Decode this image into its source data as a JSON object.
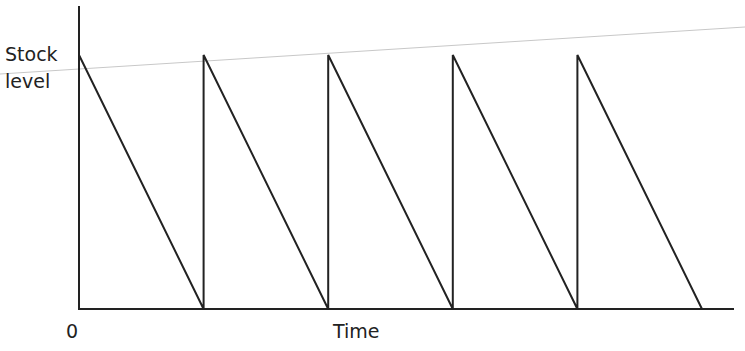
{
  "chart_data": {
    "type": "line",
    "title": "",
    "xlabel": "Time",
    "ylabel": "Stock level",
    "ylabel_lines": [
      "Stock",
      "level"
    ],
    "origin_label": "0",
    "grid": false,
    "legend": null,
    "x": [
      0,
      1,
      1,
      2,
      2,
      3,
      3,
      4,
      4,
      5
    ],
    "y": [
      1,
      0,
      1,
      0,
      1,
      0,
      1,
      0,
      1,
      0
    ],
    "cycles": 5,
    "reference_line": {
      "description": "faint slightly rising gray line across the top",
      "color": "#c8c8c8"
    },
    "colors": {
      "series": "#222222",
      "reference": "#c8c8c8"
    }
  },
  "labels": {
    "y_line1": "Stock",
    "y_line2": "level",
    "x": "Time",
    "origin": "0"
  }
}
